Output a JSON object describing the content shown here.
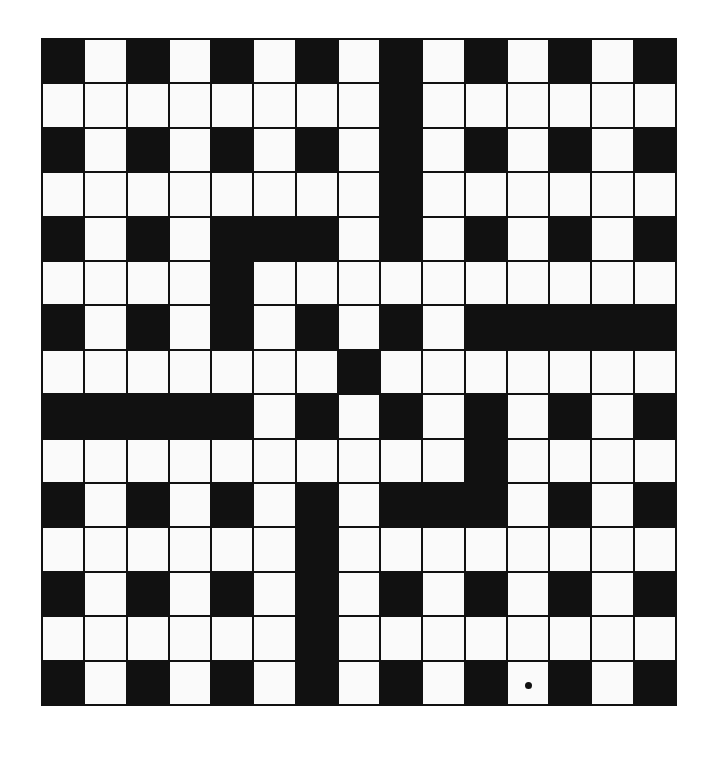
{
  "puzzle": {
    "type": "crossword",
    "rows": 15,
    "cols": 15,
    "legend": {
      "B": "black square",
      "W": "white square"
    },
    "grid": [
      "BWBWBWBWBWBWBWB",
      "WWWWWWWWBWWWWWW",
      "BWBWBWBWBWBWBWB",
      "WWWWWWWWBWWWWWW",
      "BWBWBBBWBWBWBWB",
      "WWWWBWWWWWWWWWW",
      "BWBWBWBWBWBBBBB",
      "WWWWWWWBWWWWWWW",
      "BBBBBWBWBWBWBWB",
      "WWWWWWWWWWBWWWW",
      "BWBWBWBWBBBWBWB",
      "WWWWWWBWWWWWWWW",
      "BWBWBWBWBWBWBWB",
      "WWWWWWBWWWWWWWW",
      "BWBWBWBWBWBWBWB"
    ],
    "marked_cells": [
      {
        "row": 15,
        "col": 12,
        "mark": "dot"
      }
    ],
    "colors": {
      "black": "#111111",
      "white": "#fafafa"
    }
  }
}
